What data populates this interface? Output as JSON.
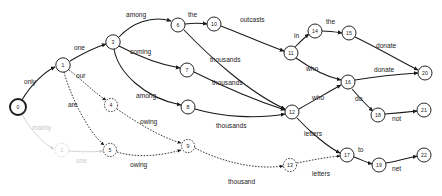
{
  "graph": {
    "type": "word-lattice",
    "title": "",
    "width": 442,
    "height": 196,
    "nodes": [
      {
        "id": "0",
        "label": "0",
        "x": 18,
        "y": 107,
        "r": 8.0,
        "style": "start"
      },
      {
        "id": "1",
        "label": "1",
        "x": 63,
        "y": 65,
        "r": 7.2,
        "style": "solid"
      },
      {
        "id": "2",
        "label": "2",
        "x": 62,
        "y": 150,
        "r": 6.8,
        "style": "faded"
      },
      {
        "id": "3",
        "label": "3",
        "x": 113,
        "y": 42,
        "r": 7.2,
        "style": "solid"
      },
      {
        "id": "4",
        "label": "4",
        "x": 111,
        "y": 105,
        "r": 6.6,
        "style": "dashed"
      },
      {
        "id": "5",
        "label": "5",
        "x": 110,
        "y": 150,
        "r": 6.6,
        "style": "dashed"
      },
      {
        "id": "6",
        "label": "6",
        "x": 178,
        "y": 25,
        "r": 7.0,
        "style": "solid"
      },
      {
        "id": "7",
        "label": "7",
        "x": 187,
        "y": 70,
        "r": 7.0,
        "style": "solid"
      },
      {
        "id": "8",
        "label": "8",
        "x": 188,
        "y": 107,
        "r": 7.0,
        "style": "solid"
      },
      {
        "id": "9",
        "label": "9",
        "x": 188,
        "y": 146,
        "r": 6.6,
        "style": "dashed"
      },
      {
        "id": "10",
        "label": "10",
        "x": 214,
        "y": 24,
        "r": 7.0,
        "style": "solid"
      },
      {
        "id": "11",
        "label": "11",
        "x": 291,
        "y": 53,
        "r": 7.0,
        "style": "solid"
      },
      {
        "id": "12",
        "label": "12",
        "x": 292,
        "y": 112,
        "r": 7.0,
        "style": "solid"
      },
      {
        "id": "13",
        "label": "13",
        "x": 290,
        "y": 165,
        "r": 6.6,
        "style": "dashed"
      },
      {
        "id": "14",
        "label": "14",
        "x": 315,
        "y": 31,
        "r": 7.0,
        "style": "solid"
      },
      {
        "id": "15",
        "label": "15",
        "x": 349,
        "y": 33,
        "r": 7.0,
        "style": "solid"
      },
      {
        "id": "16",
        "label": "16",
        "x": 348,
        "y": 82,
        "r": 7.0,
        "style": "solid"
      },
      {
        "id": "17",
        "label": "17",
        "x": 347,
        "y": 155,
        "r": 7.0,
        "style": "solid"
      },
      {
        "id": "18",
        "label": "18",
        "x": 378,
        "y": 115,
        "r": 7.0,
        "style": "solid"
      },
      {
        "id": "19",
        "label": "19",
        "x": 379,
        "y": 165,
        "r": 7.0,
        "style": "solid"
      },
      {
        "id": "20",
        "label": "20",
        "x": 425,
        "y": 73,
        "r": 7.0,
        "style": "solid"
      },
      {
        "id": "21",
        "label": "21",
        "x": 424,
        "y": 110,
        "r": 7.0,
        "style": "solid"
      },
      {
        "id": "22",
        "label": "22",
        "x": 424,
        "y": 155,
        "r": 7.0,
        "style": "solid"
      }
    ],
    "edges": [
      {
        "from": "0",
        "to": "1",
        "word": "only",
        "style": "solid",
        "path": "M 22 100 C 30 86 44 72 55 67",
        "lx": 24,
        "ly": 84
      },
      {
        "from": "0",
        "to": "2",
        "word": "mainly",
        "style": "faded",
        "path": "M 22 114 C 30 130 44 144 54 149",
        "lx": 32,
        "ly": 130
      },
      {
        "from": "1",
        "to": "3",
        "word": "one",
        "style": "solid",
        "path": "M 70 61 C 82 54 96 47 106 44",
        "lx": 74,
        "ly": 50
      },
      {
        "from": "1",
        "to": "4",
        "word": "our",
        "style": "dashed",
        "path": "M 69 70 C 82 80 96 94 106 100",
        "lx": 76,
        "ly": 78
      },
      {
        "from": "1",
        "to": "5",
        "word": "are",
        "style": "dashed",
        "path": "M 64 72 C 70 95 88 132 104 145",
        "lx": 68,
        "ly": 107
      },
      {
        "from": "2",
        "to": "5",
        "word": "one",
        "style": "faded",
        "path": "M 69 151 C 82 152 94 152 103 151",
        "lx": 76,
        "ly": 163
      },
      {
        "from": "3",
        "to": "6",
        "word": "among",
        "style": "solid",
        "path": "M 119 37 C 132 23 152 15 171 21",
        "lx": 126,
        "ly": 17
      },
      {
        "from": "3",
        "to": "7",
        "word": "coming",
        "style": "solid",
        "path": "M 119 46 C 136 55 156 64 180 68",
        "lx": 130,
        "ly": 54
      },
      {
        "from": "3",
        "to": "8",
        "word": "among",
        "style": "solid",
        "path": "M 114 49 C 118 72 144 98 181 105",
        "lx": 136,
        "ly": 98
      },
      {
        "from": "4",
        "to": "9",
        "word": "owing",
        "style": "dashed",
        "path": "M 117 109 C 136 122 160 137 181 143",
        "lx": 140,
        "ly": 124
      },
      {
        "from": "5",
        "to": "9",
        "word": "owing",
        "style": "dashed",
        "path": "M 117 152 C 136 158 160 156 181 150",
        "lx": 130,
        "ly": 167
      },
      {
        "from": "6",
        "to": "10",
        "word": "the",
        "style": "solid",
        "path": "M 185 24 C 194 23 200 23 207 24",
        "lx": 188,
        "ly": 17
      },
      {
        "from": "6",
        "to": "12",
        "word": "thousands",
        "style": "solid",
        "path": "M 184 30 C 208 55 248 92 285 109",
        "lx": 210,
        "ly": 62
      },
      {
        "from": "7",
        "to": "12",
        "word": "thousands",
        "style": "solid",
        "path": "M 194 72 C 218 84 254 100 285 110",
        "lx": 212,
        "ly": 85
      },
      {
        "from": "8",
        "to": "12",
        "word": "thousands",
        "style": "solid",
        "path": "M 195 109 C 222 117 258 119 285 114",
        "lx": 216,
        "ly": 128
      },
      {
        "from": "9",
        "to": "13",
        "word": "thousand",
        "style": "dashed",
        "path": "M 195 148 C 222 162 256 170 283 166",
        "lx": 228,
        "ly": 184
      },
      {
        "from": "10",
        "to": "11",
        "word": "outcasts",
        "style": "solid",
        "path": "M 221 26 C 242 34 266 45 284 51",
        "lx": 240,
        "ly": 22
      },
      {
        "from": "11",
        "to": "14",
        "word": "in",
        "style": "solid",
        "path": "M 295 47 C 301 41 305 37 309 34",
        "lx": 294,
        "ly": 38
      },
      {
        "from": "11",
        "to": "16",
        "word": "who",
        "style": "solid",
        "path": "M 296 58 C 310 68 328 77 341 80",
        "lx": 306,
        "ly": 71
      },
      {
        "from": "12",
        "to": "16",
        "word": "who",
        "style": "solid",
        "path": "M 299 109 C 315 100 330 91 341 85",
        "lx": 312,
        "ly": 100
      },
      {
        "from": "12",
        "to": "17",
        "word": "letters",
        "style": "solid",
        "path": "M 297 118 C 310 132 328 147 340 153",
        "lx": 304,
        "ly": 136
      },
      {
        "from": "13",
        "to": "17",
        "word": "letters",
        "style": "dashed",
        "path": "M 297 163 C 312 160 328 157 340 156",
        "lx": 312,
        "ly": 176
      },
      {
        "from": "14",
        "to": "15",
        "word": "the",
        "style": "solid",
        "path": "M 322 31 C 330 31 336 32 342 33",
        "lx": 326,
        "ly": 24
      },
      {
        "from": "15",
        "to": "20",
        "word": "donate",
        "style": "solid",
        "path": "M 355 37 C 378 48 402 62 418 70",
        "lx": 376,
        "ly": 48
      },
      {
        "from": "16",
        "to": "20",
        "word": "donate",
        "style": "solid",
        "path": "M 355 80 C 378 76 400 74 418 73",
        "lx": 374,
        "ly": 72
      },
      {
        "from": "16",
        "to": "18",
        "word": "do",
        "style": "solid",
        "path": "M 352 89 C 360 98 368 107 373 111",
        "lx": 355,
        "ly": 101
      },
      {
        "from": "17",
        "to": "19",
        "word": "to",
        "style": "solid",
        "path": "M 354 157 C 362 160 368 163 372 164",
        "lx": 358,
        "ly": 152
      },
      {
        "from": "18",
        "to": "21",
        "word": "not",
        "style": "solid",
        "path": "M 385 114 C 398 113 408 112 417 111",
        "lx": 392,
        "ly": 121
      },
      {
        "from": "19",
        "to": "22",
        "word": "net",
        "style": "solid",
        "path": "M 386 163 C 398 161 408 158 417 156",
        "lx": 392,
        "ly": 171
      }
    ],
    "legend": {
      "solid_meaning": "primary hypothesis path",
      "dashed_meaning": "alternative hypothesis path",
      "faded_meaning": "pruned path"
    },
    "colors": {
      "ink": "#1a1a1a",
      "faded": "#cfcfcf",
      "background": "#ffffff"
    }
  }
}
